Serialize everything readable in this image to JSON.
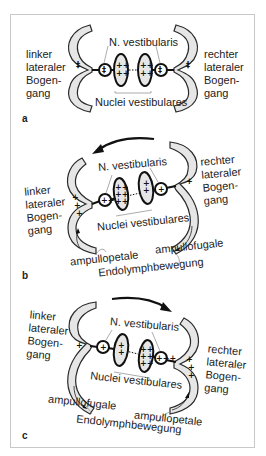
{
  "figure": {
    "panels": [
      {
        "letter": "a",
        "left_label": [
          "linker",
          "lateraler",
          "Bogen-",
          "gang"
        ],
        "right_label": [
          "rechter",
          "lateraler",
          "Bogen-",
          "gang"
        ],
        "nerve_label": "N. vestibularis",
        "nuclei_label": "Nuclei vestibulares",
        "left_canal_charge": "++",
        "right_canal_charge": "++",
        "left_ganglion_charge": "++",
        "right_ganglion_charge": "++",
        "left_nucleus_charge": "++++",
        "right_nucleus_charge": "++++",
        "rotation_arrow": "none"
      },
      {
        "letter": "b",
        "left_label": [
          "linker",
          "lateraler",
          "Bogen-",
          "gang"
        ],
        "right_label": [
          "rechter",
          "lateraler",
          "Bogen-",
          "gang"
        ],
        "nerve_label": "N. vestibularis",
        "nuclei_label": "Nuclei vestibulares",
        "left_flow_label": "ampullopetale",
        "right_flow_label": "ampullofugale",
        "movement_label": "Endolymphbewegung",
        "left_canal_charge": "+++",
        "right_canal_charge": "+",
        "left_ganglion_charge": "+++",
        "right_ganglion_charge": "+",
        "left_nucleus_charge": "++++++",
        "right_nucleus_charge": "++",
        "rotation_arrow": "left"
      },
      {
        "letter": "c",
        "left_label": [
          "linker",
          "lateraler",
          "Bogen-",
          "gang"
        ],
        "right_label": [
          "rechter",
          "lateraler",
          "Bogen-",
          "gang"
        ],
        "nerve_label": "N. vestibularis",
        "nuclei_label": "Nuclei vestibulares",
        "left_flow_label": "ampullofugale",
        "right_flow_label": "ampullopetale",
        "movement_label": "Endolymphbewegung",
        "left_canal_charge": "+",
        "right_canal_charge": "+++",
        "left_ganglion_charge": "+",
        "right_ganglion_charge": "+++",
        "left_nucleus_charge": "++",
        "right_nucleus_charge": "++++++",
        "rotation_arrow": "right"
      }
    ],
    "colors": {
      "canal_fill": "#e6e6e6",
      "outline": "#111111",
      "frame_border": "#c8c8c8"
    }
  }
}
